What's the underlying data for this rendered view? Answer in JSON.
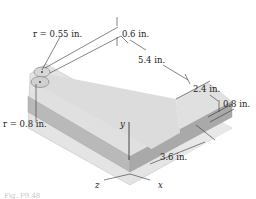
{
  "diagram": {
    "type": "isometric-l-shaped-block",
    "labels": {
      "r_top": "r = 0.55 in.",
      "r_bottom": "r = 0.8 in.",
      "dim_06": "0.6 in.",
      "dim_54": "5.4 in.",
      "dim_24": "2.4 in.",
      "dim_08": "0.8 in.",
      "dim_36": "3.6 in."
    },
    "axes": {
      "x": "x",
      "y": "y",
      "z": "z"
    },
    "caption": "Fig. P9.48",
    "colors": {
      "top_face": "#e6e6e6",
      "side_face": "#bfbfbf",
      "front_face": "#a8a8a8",
      "line": "#333333"
    }
  }
}
